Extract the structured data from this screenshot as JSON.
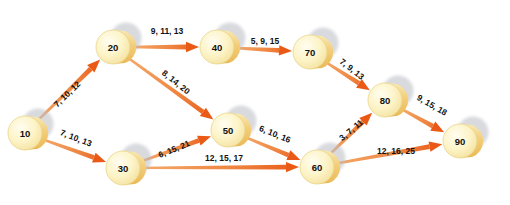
{
  "diagram": {
    "type": "activity-on-arrow-network",
    "title": "",
    "colors": {
      "node_fill_light": "#fdf3c8",
      "node_fill_mid": "#f7e6a8",
      "node_edge": "#e8d489",
      "cylinder_side": "#f2c96a",
      "shadow": "#b9bcc4",
      "arrow_start": "#f4a96a",
      "arrow_end": "#ea5a16",
      "label_text": "#111111",
      "background": "#ffffff"
    },
    "nodes": [
      {
        "id": "10",
        "label": "10",
        "x": 25,
        "y": 133
      },
      {
        "id": "20",
        "label": "20",
        "x": 113,
        "y": 47
      },
      {
        "id": "30",
        "label": "30",
        "x": 123,
        "y": 168
      },
      {
        "id": "40",
        "label": "40",
        "x": 217,
        "y": 47
      },
      {
        "id": "50",
        "label": "50",
        "x": 228,
        "y": 130
      },
      {
        "id": "60",
        "label": "60",
        "x": 317,
        "y": 167
      },
      {
        "id": "70",
        "label": "70",
        "x": 310,
        "y": 52
      },
      {
        "id": "80",
        "label": "80",
        "x": 385,
        "y": 100
      },
      {
        "id": "90",
        "label": "90",
        "x": 460,
        "y": 141
      }
    ],
    "edges": [
      {
        "from": "10",
        "to": "20",
        "label": "7, 10, 12",
        "lx": 67,
        "ly": 94,
        "rotate": -44
      },
      {
        "from": "10",
        "to": "30",
        "label": "7, 10, 13",
        "lx": 76,
        "ly": 138,
        "rotate": 21
      },
      {
        "from": "20",
        "to": "40",
        "label": "9, 11, 13",
        "lx": 167,
        "ly": 31,
        "rotate": 0
      },
      {
        "from": "20",
        "to": "50",
        "label": "8, 14, 20",
        "lx": 176,
        "ly": 82,
        "rotate": 39
      },
      {
        "from": "30",
        "to": "50",
        "label": "6, 15, 21",
        "lx": 174,
        "ly": 149,
        "rotate": -22
      },
      {
        "from": "30",
        "to": "60",
        "label": "12, 15, 17",
        "lx": 224,
        "ly": 158,
        "rotate": 0
      },
      {
        "from": "40",
        "to": "70",
        "label": "5, 9, 15",
        "lx": 265,
        "ly": 41,
        "rotate": 0
      },
      {
        "from": "50",
        "to": "60",
        "label": "6, 10, 16",
        "lx": 275,
        "ly": 134,
        "rotate": 22
      },
      {
        "from": "60",
        "to": "80",
        "label": "3, 7, 11",
        "lx": 351,
        "ly": 130,
        "rotate": -40
      },
      {
        "from": "60",
        "to": "90",
        "label": "12, 16, 25",
        "lx": 396,
        "ly": 151,
        "rotate": 0
      },
      {
        "from": "70",
        "to": "80",
        "label": "7, 9, 13",
        "lx": 352,
        "ly": 69,
        "rotate": 38
      },
      {
        "from": "80",
        "to": "90",
        "label": "9, 15, 18",
        "lx": 432,
        "ly": 105,
        "rotate": 30
      }
    ]
  }
}
